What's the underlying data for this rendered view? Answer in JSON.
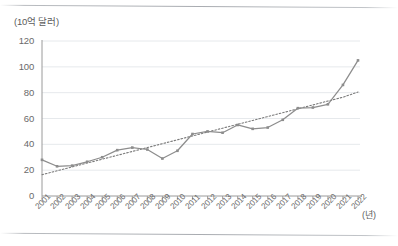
{
  "chart_data": {
    "type": "line",
    "title": "",
    "xlabel": "(년)",
    "ylabel": "(10억 달러)",
    "ylim": [
      0,
      120
    ],
    "yticks": [
      0,
      20,
      40,
      60,
      80,
      100,
      120
    ],
    "grid": true,
    "legend": "none",
    "categories": [
      "2001",
      "2002",
      "2003",
      "2004",
      "2005",
      "2006",
      "2007",
      "2008",
      "2009",
      "2010",
      "2011",
      "2012",
      "2013",
      "2014",
      "2015",
      "2016",
      "2017",
      "2018",
      "2019",
      "2020",
      "2021",
      "2022"
    ],
    "series": [
      {
        "name": "value",
        "marker": "square",
        "style": "solid",
        "color": "#8d8d8d",
        "values": [
          28,
          23,
          23.5,
          26.5,
          30,
          35.5,
          37.5,
          36,
          29,
          35,
          48,
          50,
          49,
          55,
          52,
          53,
          59,
          68,
          68.5,
          71,
          86,
          105
        ]
      },
      {
        "name": "trendline",
        "style": "dotted",
        "color": "#7a7a7a",
        "values": [
          16.5,
          19.5,
          22.5,
          25.5,
          28.5,
          31.5,
          34.5,
          37.5,
          40.5,
          43.5,
          46.5,
          49.5,
          52.5,
          55.5,
          58.5,
          61.5,
          64.5,
          67.5,
          70.5,
          73.5,
          76.5,
          80.5
        ]
      }
    ]
  },
  "axis": {
    "y_title": "(10억 달러)",
    "x_title": "(년)"
  }
}
